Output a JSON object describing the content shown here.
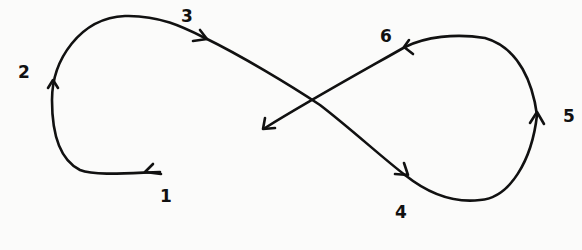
{
  "diagram": {
    "type": "figure-eight path",
    "stroke_color": "#111111",
    "background": "#fbfbfa",
    "waypoints": [
      {
        "id": "1",
        "label": "1",
        "x": 160,
        "y": 190
      },
      {
        "id": "2",
        "label": "2",
        "x": 18,
        "y": 64
      },
      {
        "id": "3",
        "label": "3",
        "x": 181,
        "y": 8
      },
      {
        "id": "4",
        "label": "4",
        "x": 395,
        "y": 205
      },
      {
        "id": "5",
        "label": "5",
        "x": 563,
        "y": 108
      },
      {
        "id": "6",
        "label": "6",
        "x": 380,
        "y": 28
      }
    ],
    "sequence": [
      "1",
      "2",
      "3",
      "4",
      "5",
      "6"
    ]
  }
}
